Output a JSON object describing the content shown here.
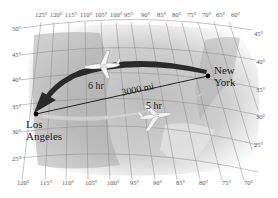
{
  "figure": {
    "title": "",
    "longitude_labels_top": [
      "125°",
      "120°",
      "115°",
      "110°",
      "105°",
      "100°",
      "95°",
      "90°",
      "85°",
      "80°",
      "75°",
      "70°",
      "65°",
      "60°"
    ],
    "longitude_labels_bottom": [
      "120°",
      "115°",
      "110°",
      "105°",
      "100°",
      "95°",
      "90°",
      "85°",
      "80°",
      "75°",
      "70°"
    ],
    "latitude_labels_left": [
      "50°",
      "45°",
      "40°",
      "35°",
      "30°",
      "25°"
    ],
    "latitude_labels_right": [
      "45°",
      "40°",
      "35°",
      "30°",
      "25°"
    ],
    "cities": {
      "new_york": {
        "line1": "New",
        "line2": "York"
      },
      "los_angeles": {
        "line1": "Los",
        "line2": "Angeles"
      }
    },
    "routes": {
      "westbound": {
        "label": "6 hr",
        "color": "#2a2a2a"
      },
      "eastbound": {
        "label": "5 hr",
        "color": "#c8c8c8"
      },
      "distance": {
        "label": "3000 mi"
      }
    }
  }
}
